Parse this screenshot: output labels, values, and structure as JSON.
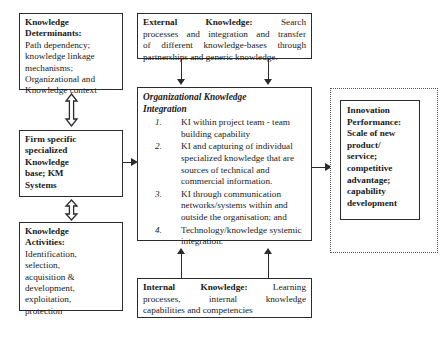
{
  "diagram": {
    "type": "flow-diagram",
    "colors": {
      "border": "#2b2b2b",
      "dotted_border": "#555555",
      "background": "#ffffff",
      "text": "#1a1a1a"
    }
  },
  "boxes": {
    "determinants": {
      "heading": "Knowledge Determinants:",
      "line1": "Knowledge",
      "line2": "Determinants:",
      "line3": "Path dependency;",
      "line4": "knowledge linkage",
      "line5": "mechanisms;",
      "line6": "Organizational and",
      "line7": "Knowledge context"
    },
    "firm": {
      "line1": "Firm specific",
      "line2": "specialized",
      "line3": "Knowledge",
      "line4": "base; KM",
      "line5": "Systems"
    },
    "activities": {
      "line1": "Knowledge",
      "line2": "Activities:",
      "line3": "Identification,",
      "line4": "selection,",
      "line5": "acquisition &",
      "line6": "development,",
      "line7": "exploitation,",
      "line8": "protection"
    },
    "external": {
      "label": "External",
      "label2": "Knowledge:",
      "line1_rest": "Search",
      "line2": "processes and integration and transfer",
      "line3": "of different knowledge-bases through",
      "line4": "partnerships and generic knowledge."
    },
    "central": {
      "heading_line1": "Organizational Knowledge",
      "heading_line2": "Integration",
      "items": [
        {
          "num": "1.",
          "text": "KI within project team - team building capability"
        },
        {
          "num": "2.",
          "text": "KI and capturing of individual specialized knowledge that are sources of technical and commercial information."
        },
        {
          "num": "3.",
          "text": "KI through communication networks/systems within and outside the organisation; and"
        },
        {
          "num": "4.",
          "text": "Technology/knowledge systemic integration."
        }
      ]
    },
    "internal": {
      "label": "Internal",
      "label2": "Knowledge:",
      "line1_rest": "Learning",
      "line2_a": "processes,",
      "line2_b": "internal",
      "line2_c": "knowledge",
      "line3": "capabilities and competencies"
    },
    "innovation": {
      "line1": "Innovation",
      "line2": "Performance:",
      "line3": "Scale of new",
      "line4": "product/",
      "line5": "service;",
      "line6": "competitive",
      "line7": "advantage;",
      "line8": "capability",
      "line9": "development"
    }
  },
  "connectors": {
    "determinants_to_firm": "double-headed-vertical-arrow",
    "firm_to_activities": "double-headed-vertical-arrow",
    "external_to_central_left": "arrow-down",
    "external_to_central_right": "arrow-down",
    "internal_to_central_left": "arrow-up",
    "internal_to_central_right": "arrow-up",
    "firm_to_central": "arrow-right",
    "central_to_innovation": "arrow-right"
  }
}
